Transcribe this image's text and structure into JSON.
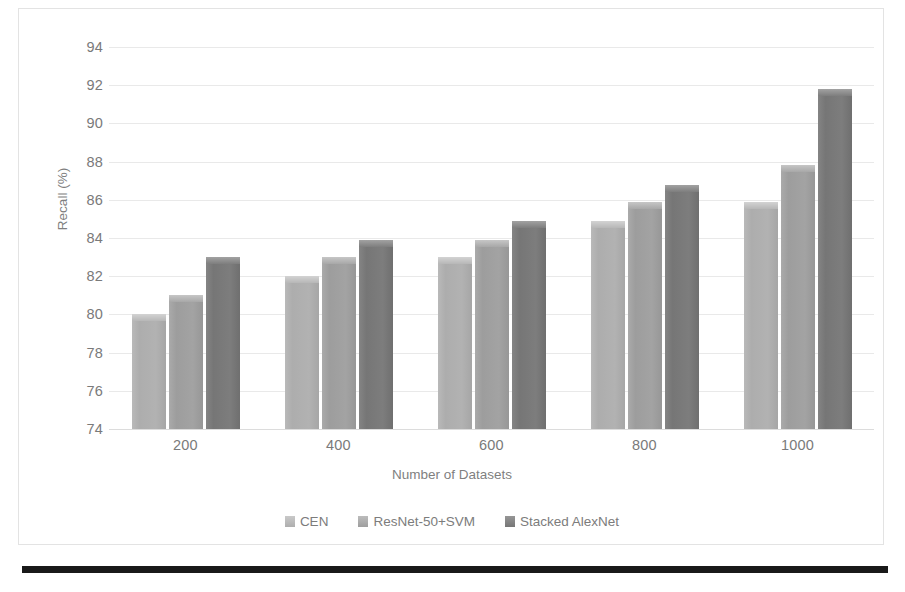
{
  "chart_data": {
    "type": "bar",
    "title": "",
    "xlabel": "Number of Datasets",
    "ylabel": "Recall (%)",
    "categories": [
      "200",
      "400",
      "600",
      "800",
      "1000"
    ],
    "ylim": [
      74,
      94
    ],
    "yticks": [
      74,
      76,
      78,
      80,
      82,
      84,
      86,
      88,
      90,
      92,
      94
    ],
    "grid": true,
    "legend_position": "bottom",
    "series": [
      {
        "name": "CEN",
        "color": "#b0b0b0",
        "values": [
          80.0,
          82.0,
          83.0,
          84.9,
          85.9
        ]
      },
      {
        "name": "ResNet-50+SVM",
        "color": "#a0a0a0",
        "values": [
          81.0,
          83.0,
          83.9,
          85.9,
          87.8
        ]
      },
      {
        "name": "Stacked AlexNet",
        "color": "#787878",
        "values": [
          83.0,
          83.9,
          84.9,
          86.8,
          91.8
        ]
      }
    ]
  },
  "axis": {
    "y_title": "Recall (%)",
    "x_title": "Number of Datasets",
    "y_tick_labels": [
      "94",
      "92",
      "90",
      "88",
      "86",
      "84",
      "82",
      "80",
      "78",
      "76",
      "74"
    ],
    "x_tick_labels": [
      "200",
      "400",
      "600",
      "800",
      "1000"
    ]
  },
  "legend": {
    "items": [
      {
        "label": "CEN"
      },
      {
        "label": "ResNet-50+SVM"
      },
      {
        "label": "Stacked AlexNet"
      }
    ]
  }
}
